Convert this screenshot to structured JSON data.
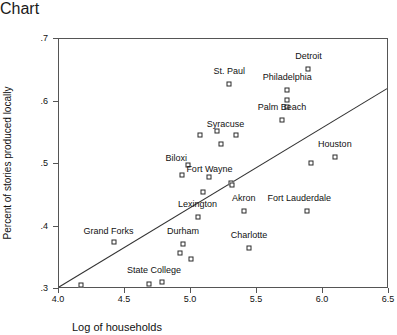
{
  "chart_data": {
    "type": "scatter",
    "title": "",
    "xlabel": "Log of households",
    "ylabel": "Percent of stories produced locally",
    "xlim": [
      4.0,
      6.5
    ],
    "ylim": [
      0.3,
      0.7
    ],
    "xticks": [
      "4.0",
      "4.5",
      "5.0",
      "5.5",
      "6.0",
      "6.5"
    ],
    "xtick_values": [
      4.0,
      4.5,
      5.0,
      5.5,
      6.0,
      6.5
    ],
    "yticks": [
      ".3",
      ".4",
      ".5",
      ".6",
      ".7"
    ],
    "ytick_values": [
      0.3,
      0.4,
      0.5,
      0.6,
      0.7
    ],
    "grid": false,
    "legend": null,
    "marker": "open-square",
    "trendline": {
      "type": "linear-fit",
      "x0": 4.0,
      "y0": 0.3,
      "x1": 6.5,
      "y1": 0.62
    },
    "points": [
      {
        "label": "Detroit",
        "x": 5.89,
        "y": 0.652,
        "label_dx": 0,
        "label_dy": -13
      },
      {
        "label": "St. Paul",
        "x": 5.29,
        "y": 0.628,
        "label_dx": 0,
        "label_dy": -13
      },
      {
        "label": "Philadelphia",
        "x": 5.73,
        "y": 0.618,
        "label_dx": 0,
        "label_dy": -13
      },
      {
        "label": "",
        "x": 5.73,
        "y": 0.603,
        "label_dx": 0,
        "label_dy": 0
      },
      {
        "label": "",
        "x": 5.73,
        "y": 0.592,
        "label_dx": 0,
        "label_dy": 0
      },
      {
        "label": "Palm Beach",
        "x": 5.69,
        "y": 0.571,
        "label_dx": 0,
        "label_dy": -13
      },
      {
        "label": "Syracuse",
        "x": 5.2,
        "y": 0.553,
        "label_dx": 8,
        "label_dy": -7
      },
      {
        "label": "",
        "x": 5.07,
        "y": 0.547,
        "label_dx": 0,
        "label_dy": 0
      },
      {
        "label": "",
        "x": 5.34,
        "y": 0.547,
        "label_dx": 0,
        "label_dy": 0
      },
      {
        "label": "",
        "x": 5.23,
        "y": 0.532,
        "label_dx": 0,
        "label_dy": 0
      },
      {
        "label": "Houston",
        "x": 6.09,
        "y": 0.512,
        "label_dx": 0,
        "label_dy": -13
      },
      {
        "label": "",
        "x": 5.91,
        "y": 0.501,
        "label_dx": 0,
        "label_dy": 0
      },
      {
        "label": "Biloxi",
        "x": 4.98,
        "y": 0.498,
        "label_dx": -12,
        "label_dy": -7
      },
      {
        "label": "",
        "x": 4.93,
        "y": 0.483,
        "label_dx": 0,
        "label_dy": 0
      },
      {
        "label": "Fort Wayne",
        "x": 5.14,
        "y": 0.48,
        "label_dx": 0,
        "label_dy": -8
      },
      {
        "label": "",
        "x": 5.3,
        "y": 0.47,
        "label_dx": 0,
        "label_dy": 0
      },
      {
        "label": "",
        "x": 5.31,
        "y": 0.466,
        "label_dx": 0,
        "label_dy": 0
      },
      {
        "label": "",
        "x": 5.09,
        "y": 0.455,
        "label_dx": 0,
        "label_dy": 0
      },
      {
        "label": "Akron",
        "x": 5.4,
        "y": 0.425,
        "label_dx": 0,
        "label_dy": -13
      },
      {
        "label": "Fort Lauderdale",
        "x": 5.88,
        "y": 0.425,
        "label_dx": -8,
        "label_dy": -13
      },
      {
        "label": "Lexington",
        "x": 5.05,
        "y": 0.416,
        "label_dx": 0,
        "label_dy": -13
      },
      {
        "label": "Grand Forks",
        "x": 4.42,
        "y": 0.375,
        "label_dx": -6,
        "label_dy": -11
      },
      {
        "label": "Durham",
        "x": 4.94,
        "y": 0.372,
        "label_dx": 0,
        "label_dy": -13
      },
      {
        "label": "Charlotte",
        "x": 5.44,
        "y": 0.366,
        "label_dx": 0,
        "label_dy": -13
      },
      {
        "label": "",
        "x": 4.92,
        "y": 0.358,
        "label_dx": 0,
        "label_dy": 0
      },
      {
        "label": "",
        "x": 5.0,
        "y": 0.348,
        "label_dx": 0,
        "label_dy": 0
      },
      {
        "label": "State College",
        "x": 4.78,
        "y": 0.311,
        "label_dx": -8,
        "label_dy": -12
      },
      {
        "label": "",
        "x": 4.17,
        "y": 0.306,
        "label_dx": 0,
        "label_dy": 0
      },
      {
        "label": "",
        "x": 4.68,
        "y": 0.308,
        "label_dx": 0,
        "label_dy": 0
      }
    ]
  },
  "style": {
    "marker_edge_color": "#2a2a2a",
    "marker_face_color": "#ffffff",
    "line_color": "#333333",
    "axis_color": "#555555",
    "text_color": "#111111"
  }
}
